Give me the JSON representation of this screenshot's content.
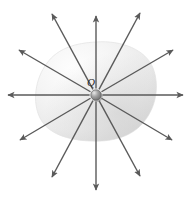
{
  "figure": {
    "width": 190,
    "height": 198,
    "background_color": "#ffffff"
  },
  "charge": {
    "label": "Q",
    "label_position": {
      "x": 91,
      "y": 86
    },
    "center": {
      "x": 96,
      "y": 95
    },
    "radius": 5.2,
    "body_color": "#8a8a8a",
    "highlight_color": "#dcdcdc",
    "edge_color": "#4a4a4a"
  },
  "surface": {
    "name": "gaussian-surface",
    "description": "irregular closed blob surface enclosing the charge",
    "center": {
      "x": 96,
      "y": 92
    },
    "radius_x": 59,
    "radius_y": 50,
    "fill_light": "#fdfdfd",
    "fill_mid": "#f0f0f0",
    "fill_dark": "#d8d8d8",
    "edge_color": "#e2e2e2",
    "bounds": {
      "left": 37,
      "right": 156,
      "top": 42,
      "bottom": 141
    }
  },
  "field_arrows": {
    "name": "electric-field-lines",
    "count": 12,
    "color": "#5a5a5a",
    "stroke_width": 1.4,
    "head_length": 7,
    "items": [
      {
        "id": "arrow-e",
        "label": "east",
        "angle_deg": 0,
        "tip": {
          "x": 183,
          "y": 95
        }
      },
      {
        "id": "arrow-ene",
        "label": "east-northeast",
        "angle_deg": 30,
        "tip": {
          "x": 173,
          "y": 50
        }
      },
      {
        "id": "arrow-ne",
        "label": "northeast",
        "angle_deg": 60,
        "tip": {
          "x": 140,
          "y": 13
        }
      },
      {
        "id": "arrow-n",
        "label": "north",
        "angle_deg": 90,
        "tip": {
          "x": 96,
          "y": 16
        }
      },
      {
        "id": "arrow-nnw",
        "label": "north-northwest",
        "angle_deg": 120,
        "tip": {
          "x": 52,
          "y": 14
        }
      },
      {
        "id": "arrow-wnw",
        "label": "west-northwest",
        "angle_deg": 150,
        "tip": {
          "x": 19,
          "y": 50
        }
      },
      {
        "id": "arrow-w",
        "label": "west",
        "angle_deg": 180,
        "tip": {
          "x": 8,
          "y": 95
        }
      },
      {
        "id": "arrow-wsw",
        "label": "west-southwest",
        "angle_deg": 210,
        "tip": {
          "x": 20,
          "y": 140
        }
      },
      {
        "id": "arrow-sw",
        "label": "southwest",
        "angle_deg": 240,
        "tip": {
          "x": 52,
          "y": 177
        }
      },
      {
        "id": "arrow-s",
        "label": "south",
        "angle_deg": 270,
        "tip": {
          "x": 96,
          "y": 190
        }
      },
      {
        "id": "arrow-sse",
        "label": "south-southeast",
        "angle_deg": 300,
        "tip": {
          "x": 140,
          "y": 176
        }
      },
      {
        "id": "arrow-ese",
        "label": "east-southeast",
        "angle_deg": 330,
        "tip": {
          "x": 172,
          "y": 140
        }
      }
    ]
  }
}
